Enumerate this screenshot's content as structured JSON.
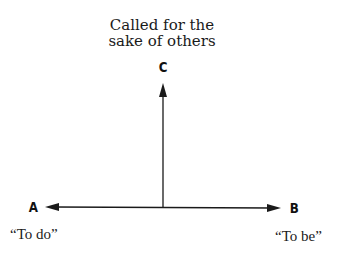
{
  "diagram": {
    "top_caption": {
      "line1": "Called for the",
      "line2": "sake of others"
    },
    "nodes": {
      "C": {
        "label": "C"
      },
      "A": {
        "label": "A",
        "caption": "“To do”"
      },
      "B": {
        "label": "B",
        "caption": "“To be”"
      }
    },
    "edges": [
      {
        "from": "origin",
        "to": "C",
        "direction": "up"
      },
      {
        "from": "origin",
        "to": "A",
        "direction": "left"
      },
      {
        "from": "origin",
        "to": "B",
        "direction": "right"
      }
    ],
    "colors": {
      "line": "#1a1a1a",
      "background": "#ffffff"
    }
  }
}
